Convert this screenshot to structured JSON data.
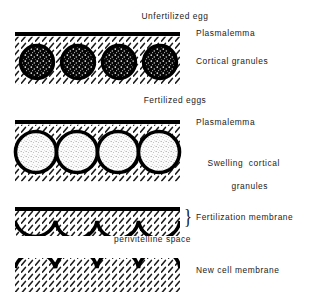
{
  "figure": {
    "title_unfertilized": "Unfertilized egg",
    "title_fertilized": "Fertilized eggs",
    "background_color": "#ffffff",
    "ink_color": "#000000"
  },
  "panels": [
    {
      "id": "unfertilized-egg",
      "heading": "Unfertilized egg",
      "labels": [
        {
          "name": "plasmalemma",
          "text": "Plasmalemma"
        },
        {
          "name": "cortical-granules",
          "text": "Cortical granules"
        }
      ],
      "granule_count": 4,
      "granule_style": "dark-dense",
      "membrane": "straight-thick-line",
      "cytoplasm_fill": "diagonal-hatch"
    },
    {
      "id": "fertilized-eggs",
      "heading": "Fertilized eggs",
      "labels": [
        {
          "name": "plasmalemma",
          "text": "Plasmalemma"
        },
        {
          "name": "swelling-cortical-granules",
          "text_line1": "Swelling  cortical",
          "text_line2": "granules"
        }
      ],
      "granule_count": 4,
      "granule_style": "light-stippled-swollen",
      "membrane": "straight-thick-line",
      "cytoplasm_fill": "diagonal-hatch"
    },
    {
      "id": "post-exocytosis",
      "heading": "",
      "labels": [
        {
          "name": "fertilization-membrane",
          "text": "Fertilization membrane"
        },
        {
          "name": "perivitelline-space",
          "text": "perivitelline space"
        },
        {
          "name": "new-cell-membrane",
          "text": "New cell membrane"
        }
      ],
      "scallop_count": 4,
      "membrane": "scalloped-arcs",
      "cytoplasm_fill": "diagonal-hatch",
      "brace_glyph": "}"
    }
  ]
}
